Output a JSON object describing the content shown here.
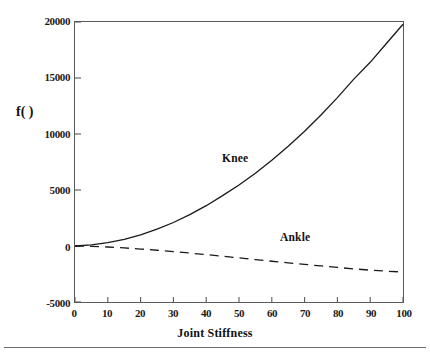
{
  "figure": {
    "background_color": "#ffffff",
    "frame_color": "#5a5a5a",
    "has_footer_rule": true
  },
  "chart_data": {
    "type": "line",
    "title": "",
    "xlabel": "Joint Stiffness",
    "ylabel": "f( )",
    "xlim": [
      0,
      100
    ],
    "ylim": [
      -5000,
      20000
    ],
    "xticks": [
      0,
      10,
      20,
      30,
      40,
      50,
      60,
      70,
      80,
      90,
      100
    ],
    "xtick_labels": [
      "0",
      "10",
      "20",
      "30",
      "40",
      "50",
      "60",
      "70",
      "80",
      "90",
      "100"
    ],
    "yticks": [
      -5000,
      0,
      5000,
      10000,
      15000,
      20000
    ],
    "ytick_labels": [
      "-5000",
      "0",
      "5000",
      "10000",
      "15000",
      "20000"
    ],
    "grid": false,
    "legend": "inline-annotations",
    "x": [
      0,
      5,
      10,
      15,
      20,
      25,
      30,
      35,
      40,
      45,
      50,
      55,
      60,
      65,
      70,
      75,
      80,
      85,
      90,
      95,
      100
    ],
    "series": [
      {
        "name": "Knee",
        "style": "solid",
        "color": "#1a1a1a",
        "annotation": "Knee",
        "annotation_x": 45,
        "annotation_y": 8200,
        "values": [
          0,
          100,
          300,
          600,
          1000,
          1500,
          2100,
          2800,
          3600,
          4500,
          5450,
          6500,
          7650,
          8900,
          10250,
          11700,
          13250,
          14900,
          16400,
          18100,
          19800
        ]
      },
      {
        "name": "Ankle",
        "style": "dashed",
        "color": "#1a1a1a",
        "annotation": "Ankle",
        "annotation_x": 72,
        "annotation_y": 1200,
        "values": [
          0,
          -30,
          -90,
          -170,
          -270,
          -380,
          -500,
          -630,
          -770,
          -910,
          -1060,
          -1210,
          -1360,
          -1500,
          -1640,
          -1780,
          -1910,
          -2040,
          -2160,
          -2250,
          -2320
        ]
      }
    ]
  }
}
